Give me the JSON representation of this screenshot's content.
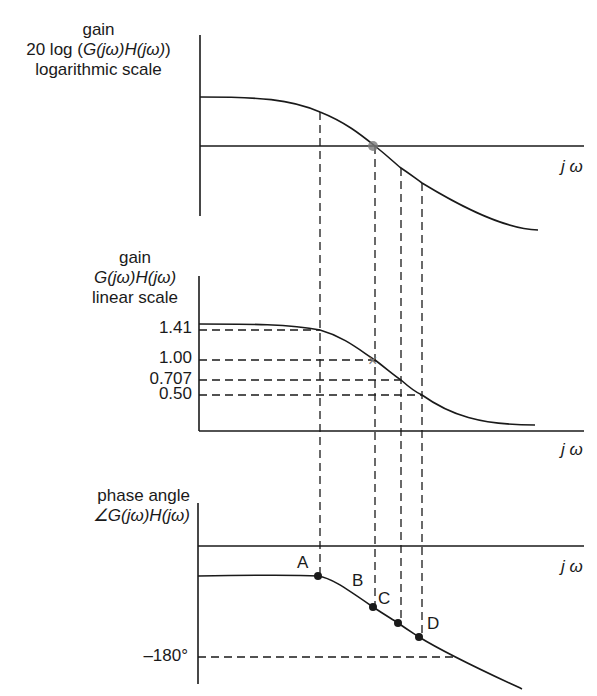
{
  "panels": {
    "log_gain": {
      "label_line1": "gain",
      "label_line2_prefix": "20 log (",
      "label_line2_expr": "G(jω)H(jω)",
      "label_line2_suffix": ")",
      "label_line3": "logarithmic scale",
      "x_axis_label": "j ω"
    },
    "linear_gain": {
      "label_line1": "gain",
      "label_line2_expr": "G(jω)H(jω)",
      "label_line3": "linear scale",
      "ticks": [
        "1.41",
        "1.00",
        "0.707",
        "0.50"
      ],
      "x_axis_label": "j ω"
    },
    "phase": {
      "label_line1": "phase angle",
      "label_line2_expr": "∠G(jω)H(jω)",
      "tick_180": "–180°",
      "x_axis_label": "j ω",
      "points": [
        "A",
        "B",
        "C",
        "D"
      ]
    }
  },
  "colors": {
    "line": "#1a1a1a",
    "marker": "#7a7a7a"
  }
}
